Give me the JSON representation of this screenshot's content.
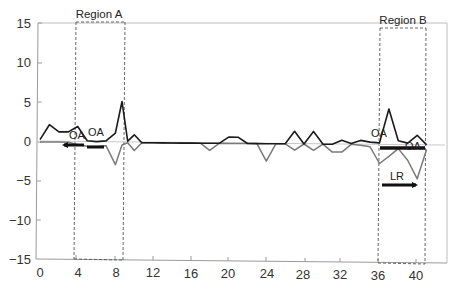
{
  "chart_data": {
    "type": "line",
    "title": "",
    "xlabel": "",
    "ylabel": "",
    "xlim": [
      0,
      44
    ],
    "ylim": [
      -15,
      15
    ],
    "grid": false,
    "x_ticks": [
      0,
      4,
      8,
      12,
      16,
      20,
      24,
      28,
      32,
      36,
      40
    ],
    "y_ticks": [
      15,
      10,
      5,
      0,
      -5,
      -10,
      -15
    ],
    "series": [
      {
        "name": "positive",
        "color": "#1a1a1a",
        "x": [
          0,
          1,
          2,
          3,
          4,
          5,
          6,
          7,
          8,
          8.7,
          9.3,
          10,
          10.8,
          11.5,
          12,
          13,
          14,
          15,
          16,
          17,
          18,
          19,
          20,
          21,
          22,
          23,
          24,
          25,
          26,
          27,
          28,
          29,
          30,
          31,
          32,
          33,
          34,
          35,
          36,
          37,
          38,
          39,
          40,
          41
        ],
        "values": [
          0.3,
          2.2,
          1.3,
          1.3,
          2.0,
          0.2,
          0.1,
          0.2,
          1.2,
          5.2,
          0.2,
          1.0,
          0.0,
          0.0,
          0.0,
          0.0,
          0.0,
          0.0,
          0.0,
          0.0,
          0.0,
          0.0,
          0.8,
          0.8,
          0.0,
          0.0,
          0.0,
          0.0,
          0.0,
          1.6,
          0.0,
          1.6,
          0.0,
          0.0,
          0.5,
          0.1,
          0.5,
          0.3,
          0.2,
          4.5,
          0.5,
          0.2,
          1.2,
          0.0
        ]
      },
      {
        "name": "negative",
        "color": "#7a7a7a",
        "x": [
          0,
          1,
          2,
          3,
          4,
          5,
          6,
          7,
          8,
          8.7,
          9.3,
          10,
          10.8,
          11.5,
          12,
          13,
          14,
          15,
          16,
          17,
          18,
          19,
          20,
          21,
          22,
          23,
          24,
          25,
          26,
          27,
          28,
          29,
          30,
          31,
          32,
          33,
          34,
          35,
          36,
          37,
          38,
          39,
          40,
          41
        ],
        "values": [
          0.0,
          0.0,
          0.0,
          0.0,
          -0.3,
          -0.5,
          -0.5,
          -0.4,
          -2.8,
          -0.3,
          0.0,
          -1.0,
          0.0,
          0.0,
          0.0,
          0.0,
          0.0,
          0.0,
          0.0,
          0.0,
          -0.9,
          0.0,
          0.0,
          0.0,
          0.0,
          0.0,
          -2.2,
          0.0,
          0.0,
          -0.8,
          0.0,
          -0.8,
          0.0,
          -1.0,
          -1.0,
          0.0,
          -0.1,
          -0.3,
          -2.4,
          -1.5,
          -0.5,
          -2.0,
          -4.3,
          -0.6
        ]
      }
    ],
    "regions": [
      {
        "label": "Region A",
        "x_start": 4,
        "x_end": 9.2,
        "y_top": 15.2,
        "y_bottom": -15
      },
      {
        "label": "Region B",
        "x_start": 36.3,
        "x_end": 41.2,
        "y_top": 14.5,
        "y_bottom": -15.4
      }
    ],
    "annotations": [
      {
        "text": "OA",
        "x": 3.8,
        "y": 0.2
      },
      {
        "text": "OA",
        "x": 6.0,
        "y": 0.5
      },
      {
        "text": "OA",
        "x": 36.2,
        "y": 0.9
      },
      {
        "text": "OA",
        "x": 39.5,
        "y": -0.9
      },
      {
        "text": "LR",
        "x": 38.0,
        "y": -5.8
      }
    ],
    "arrows": [
      {
        "direction": "left",
        "x_from": 4.9,
        "x_to": 2.4,
        "y": -0.3
      },
      {
        "direction": "right",
        "x_from": 5.2,
        "x_to": 7.4,
        "y": -0.6
      },
      {
        "direction": "right",
        "x_from": 36.3,
        "x_to": 41.2,
        "y": -0.6
      },
      {
        "direction": "right",
        "x_from": 36.5,
        "x_to": 40.0,
        "y": -5.4
      }
    ]
  },
  "axis": {
    "y_labels": [
      "15",
      "10",
      "5",
      "0",
      "−5",
      "−10",
      "−15"
    ],
    "x_labels": [
      "0",
      "4",
      "8",
      "12",
      "16",
      "20",
      "24",
      "28",
      "32",
      "36",
      "40"
    ]
  },
  "regions": {
    "a_label": "Region A",
    "b_label": "Region B"
  },
  "annotations": {
    "oa_1": "OA",
    "oa_2": "OA",
    "oa_3": "OA",
    "oa_4": "OA",
    "lr": "LR"
  }
}
